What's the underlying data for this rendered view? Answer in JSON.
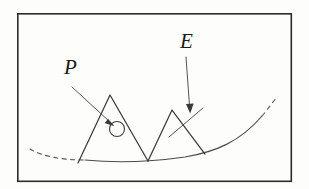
{
  "figure": {
    "title": "",
    "background_color": "#fdfdfc",
    "ink_color": "#4a4a4a",
    "frame_color": "#2b2b2b",
    "frame": {
      "x": 17,
      "y": 13,
      "width": 275,
      "height": 169
    },
    "labels": [
      {
        "id": "label-p",
        "text": "P",
        "x": 64,
        "y": 74,
        "font_size": 21,
        "style": "italic-serif",
        "meaning": "point-marker-label"
      },
      {
        "id": "label-e",
        "text": "E",
        "x": 180,
        "y": 48,
        "font_size": 21,
        "style": "italic-serif",
        "meaning": "edge-marker-label"
      }
    ],
    "leaders": [
      {
        "id": "leader-p",
        "from_x": 72,
        "from_y": 87,
        "to_x": 112,
        "to_y": 124,
        "arrow": "filled-triangle",
        "points_to": "point-circle-marker"
      },
      {
        "id": "leader-e",
        "from_x": 186,
        "from_y": 57,
        "to_x": 190,
        "to_y": 112,
        "arrow": "filled-triangle",
        "points_to": "edge-crossing-marker"
      }
    ],
    "point_marker": {
      "id": "point-circle-marker",
      "cx": 117,
      "cy": 129,
      "r": 7.5,
      "label_ref": "P"
    },
    "edge_marker": {
      "id": "edge-crossing-marker",
      "from_x": 169,
      "from_y": 137,
      "to_x": 203,
      "to_y": 108,
      "label_ref": "E"
    },
    "base_curve": {
      "id": "smooth-base-curve",
      "description": "smooth concave curve forming the underlying surface",
      "solid_segment": "M 85,160 C 115,163 150,162 185,157 C 215,152 240,142 262,116",
      "dashed_left_segment": "M 30,149 C 42,156 60,160 85,160",
      "dashed_right_segment": "M 262,116 C 268,109 272,103 277,97"
    },
    "spikes": [
      {
        "id": "spike-left",
        "description": "left triangular perturbation",
        "apex_x": 110,
        "apex_y": 95,
        "left_foot_x": 78,
        "left_foot_y": 163,
        "right_foot_x": 148,
        "right_foot_y": 161,
        "path": "M 78,163 L 110,95 L 148,161"
      },
      {
        "id": "spike-right",
        "description": "right triangular perturbation",
        "apex_x": 172,
        "apex_y": 110,
        "left_foot_x": 148,
        "left_foot_y": 161,
        "right_foot_x": 205,
        "right_foot_y": 154,
        "path": "M 148,161 L 172,110 L 205,154"
      }
    ]
  }
}
